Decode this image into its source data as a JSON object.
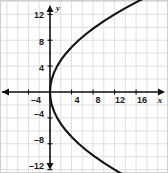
{
  "figure": {
    "background_color": "#ffffff",
    "grid_color": "#d2d2d2",
    "axis_color": "#111111",
    "curve_color": "#111111",
    "border_color": "#cfcfcf"
  },
  "axis_names": {
    "x": "x",
    "y": "y"
  },
  "x_tick_labels": [
    {
      "text": "–4",
      "value": -4
    },
    {
      "text": "4",
      "value": 4
    },
    {
      "text": "8",
      "value": 8
    },
    {
      "text": "12",
      "value": 12
    },
    {
      "text": "16",
      "value": 16
    }
  ],
  "y_tick_labels": [
    {
      "text": "12",
      "value": 12
    },
    {
      "text": "8",
      "value": 8
    },
    {
      "text": "4",
      "value": 4
    },
    {
      "text": "–4",
      "value": -4
    },
    {
      "text": "–8",
      "value": -8
    },
    {
      "text": "–12",
      "value": -12
    }
  ],
  "chart_data": {
    "type": "line",
    "title": "",
    "subtitle": "",
    "xlabel": "x",
    "ylabel": "y",
    "xlim": [
      -7,
      20.5
    ],
    "ylim": [
      -15.5,
      15.5
    ],
    "grid": true,
    "grid_step": 2,
    "legend": "none",
    "annotations": [],
    "equation": "x = y² / 12",
    "vertex": [
      0,
      0
    ],
    "opens": "right",
    "arrowheads": [
      "upper-right-end",
      "lower-right-end"
    ],
    "series": [
      {
        "name": "Parabola x = y²/12 (upper branch)",
        "x": [
          0,
          0.08,
          0.33,
          0.75,
          1.33,
          2.08,
          3,
          4.08,
          5.33,
          6.75,
          8.33,
          10.08,
          12,
          14.08,
          16.33,
          18.75,
          19.75
        ],
        "y": [
          0,
          1,
          2,
          3,
          4,
          5,
          6,
          7,
          8,
          9,
          10,
          11,
          12,
          13,
          14,
          15,
          15.4
        ]
      },
      {
        "name": "Parabola x = y²/12 (lower branch)",
        "x": [
          0,
          0.08,
          0.33,
          0.75,
          1.33,
          2.08,
          3,
          4.08,
          5.33,
          6.75,
          8.33,
          10.08,
          12,
          14.08,
          16.33,
          18.75,
          19.75
        ],
        "y": [
          0,
          -1,
          -2,
          -3,
          -4,
          -5,
          -6,
          -7,
          -8,
          -9,
          -10,
          -11,
          -12,
          -13,
          -14,
          -15,
          -15.4
        ]
      }
    ],
    "x_ticks": [
      -4,
      4,
      8,
      12,
      16
    ],
    "y_ticks": [
      12,
      8,
      4,
      -4,
      -8,
      -12
    ]
  }
}
